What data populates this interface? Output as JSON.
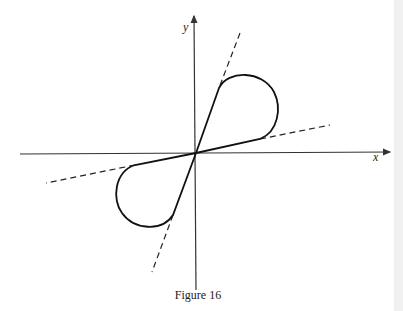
{
  "figure": {
    "caption": "Figure 16",
    "axes": {
      "x_label": "x",
      "y_label": "y"
    }
  }
}
